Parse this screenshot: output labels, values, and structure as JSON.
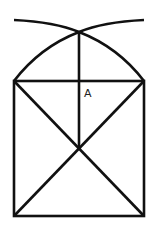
{
  "diagram": {
    "labels": {
      "point_a": "A"
    },
    "colors": {
      "line": "#111111",
      "background": "#ffffff",
      "label": "#222222"
    }
  }
}
